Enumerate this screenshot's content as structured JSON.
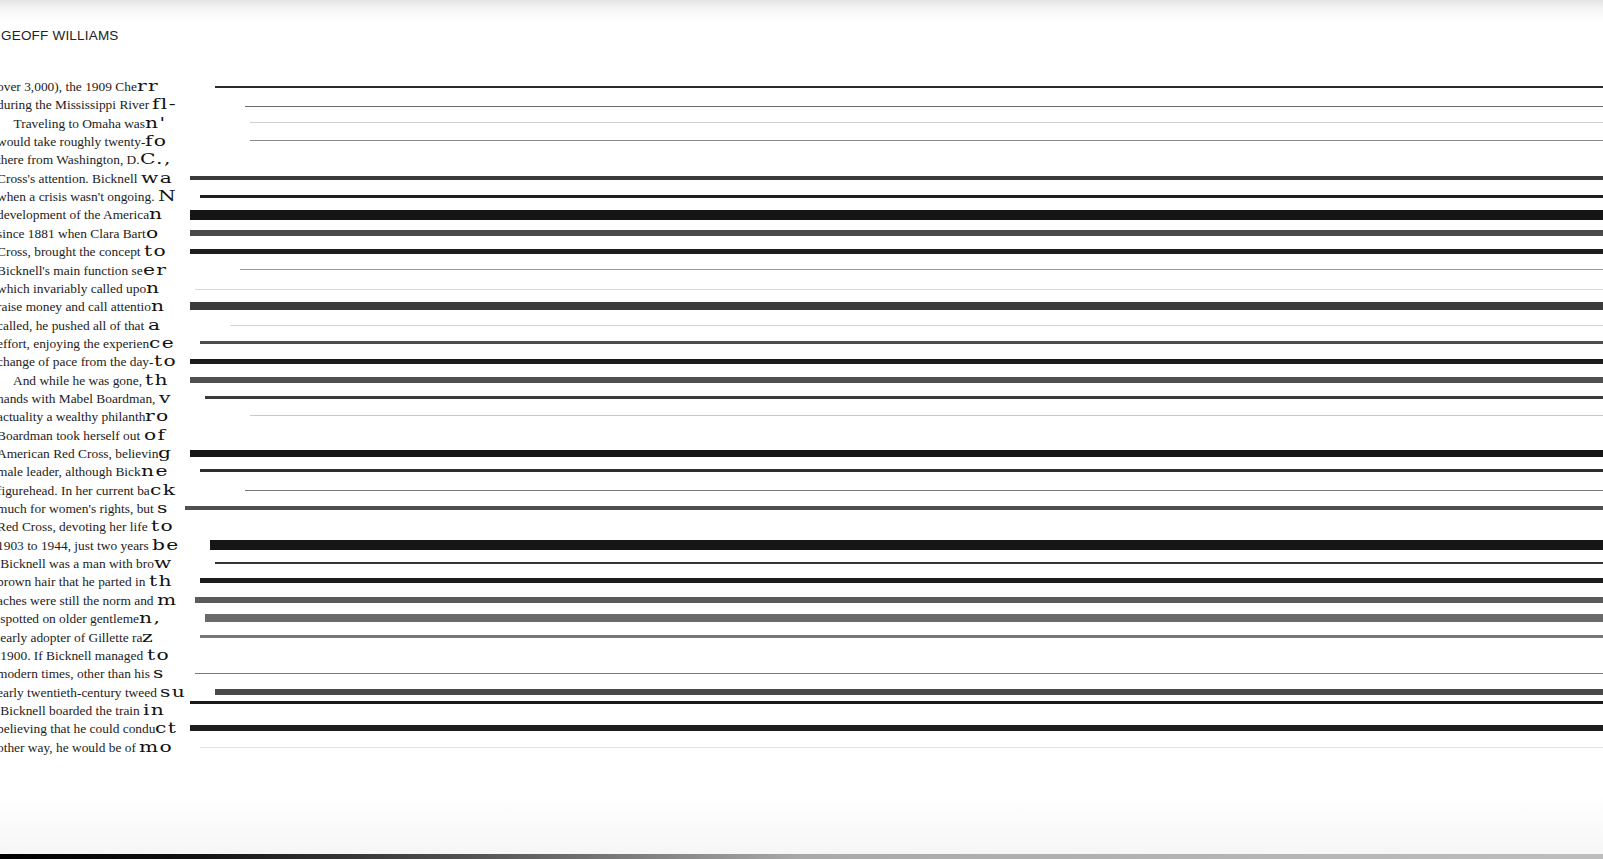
{
  "running_head": "GEOFF WILLIAMS",
  "lines": [
    {
      "text": "over 3,000), the 1909 Che",
      "tail": "rr",
      "streak": {
        "x": 215,
        "y": 9,
        "h": 2,
        "color": "#2a2a2a"
      }
    },
    {
      "text": "during the Mississippi River ",
      "tail": "fl-",
      "streak": {
        "x": 245,
        "y": 11,
        "h": 1,
        "color": "#6a6a6a"
      }
    },
    {
      "text": "     Traveling to Omaha was",
      "tail": "n'",
      "streak": {
        "x": 250,
        "y": 8,
        "h": 1,
        "color": "#cfcfcf"
      }
    },
    {
      "text": "would take roughly twenty-",
      "tail": "fo",
      "streak": {
        "x": 250,
        "y": 8,
        "h": 1,
        "color": "#8a8a8a"
      }
    },
    {
      "text": "there from Washington, D.",
      "tail": "C.,",
      "streak": null
    },
    {
      "text": "Cross's attention. Bicknell ",
      "tail": "wa",
      "streak": {
        "x": 190,
        "y": 7,
        "h": 4,
        "color": "#3a3a3a"
      }
    },
    {
      "text": "when a crisis wasn't ongoing. ",
      "tail": "N",
      "streak": {
        "x": 200,
        "y": 8,
        "h": 3,
        "color": "#1f1f1f"
      }
    },
    {
      "text": "development of the America",
      "tail": "n",
      "streak": {
        "x": 190,
        "y": 5,
        "h": 10,
        "color": "#141414"
      }
    },
    {
      "text": "since 1881 when Clara Bart",
      "tail": "o",
      "streak": {
        "x": 190,
        "y": 6,
        "h": 6,
        "color": "#4a4a4a"
      }
    },
    {
      "text": "Cross, brought the concept ",
      "tail": "to",
      "streak": {
        "x": 190,
        "y": 7,
        "h": 5,
        "color": "#1e1e1e"
      }
    },
    {
      "text": "Bicknell's main function se",
      "tail": "er",
      "streak": {
        "x": 240,
        "y": 8,
        "h": 1,
        "color": "#9a9a9a"
      }
    },
    {
      "text": "which invariably called upo",
      "tail": "n",
      "streak": {
        "x": 195,
        "y": 10,
        "h": 1,
        "color": "#d8d8d8"
      }
    },
    {
      "text": "raise money and call attentio",
      "tail": "n",
      "streak": {
        "x": 190,
        "y": 5,
        "h": 8,
        "color": "#3c3c3c"
      }
    },
    {
      "text": "called, he pushed all of that ",
      "tail": "a",
      "streak": {
        "x": 230,
        "y": 9,
        "h": 1,
        "color": "#d4d4d4"
      }
    },
    {
      "text": "effort, enjoying the experien",
      "tail": "ce",
      "streak": {
        "x": 200,
        "y": 7,
        "h": 3,
        "color": "#4e4e4e"
      }
    },
    {
      "text": "change of pace from the day-",
      "tail": "to",
      "streak": {
        "x": 190,
        "y": 7,
        "h": 5,
        "color": "#1b1b1b"
      }
    },
    {
      "text": "     And while he was gone, ",
      "tail": "th",
      "streak": {
        "x": 190,
        "y": 6,
        "h": 6,
        "color": "#505050"
      }
    },
    {
      "text": "hands with Mabel Boardman, ",
      "tail": "v",
      "streak": {
        "x": 205,
        "y": 7,
        "h": 3,
        "color": "#3a3a3a"
      }
    },
    {
      "text": "actuality a wealthy philanth",
      "tail": "ro",
      "streak": {
        "x": 250,
        "y": 8,
        "h": 1,
        "color": "#c9c9c9"
      }
    },
    {
      "text": "Boardman took herself out ",
      "tail": "of",
      "streak": null
    },
    {
      "text": "American Red Cross, believin",
      "tail": "g",
      "streak": {
        "x": 190,
        "y": 6,
        "h": 7,
        "color": "#161616"
      }
    },
    {
      "text": "male leader, although Bick",
      "tail": "ne",
      "streak": {
        "x": 200,
        "y": 7,
        "h": 3,
        "color": "#2e2e2e"
      }
    },
    {
      "text": "figurehead. In her current ba",
      "tail": "ck",
      "streak": {
        "x": 245,
        "y": 9,
        "h": 1,
        "color": "#7a7a7a"
      }
    },
    {
      "text": "much for women's rights, but ",
      "tail": "s",
      "streak": {
        "x": 185,
        "y": 7,
        "h": 4,
        "color": "#505050"
      }
    },
    {
      "text": "Red Cross, devoting her life ",
      "tail": "to",
      "streak": null
    },
    {
      "text": "1903 to 1944, just two years ",
      "tail": "be",
      "streak": {
        "x": 210,
        "y": 4,
        "h": 10,
        "color": "#161616"
      }
    },
    {
      "text": " Bicknell was a man with bro",
      "tail": "w",
      "streak": {
        "x": 215,
        "y": 8,
        "h": 2,
        "color": "#333333"
      }
    },
    {
      "text": "brown hair that he parted in ",
      "tail": "th",
      "streak": {
        "x": 200,
        "y": 6,
        "h": 5,
        "color": "#1c1c1c"
      }
    },
    {
      "text": "aches were still the norm and ",
      "tail": "m",
      "streak": {
        "x": 195,
        "y": 6,
        "h": 6,
        "color": "#5a5a5a"
      }
    },
    {
      "text": " spotted on older gentleme",
      "tail": "n,",
      "streak": {
        "x": 205,
        "y": 5,
        "h": 8,
        "color": "#6a6a6a"
      }
    },
    {
      "text": " early adopter of Gillette ra",
      "tail": "z",
      "streak": {
        "x": 200,
        "y": 7,
        "h": 3,
        "color": "#777777"
      }
    },
    {
      "text": " 1900. If Bicknell managed ",
      "tail": "to",
      "streak": null
    },
    {
      "text": "modern times, other than his ",
      "tail": "s",
      "streak": {
        "x": 195,
        "y": 9,
        "h": 1,
        "color": "#7a7a7a"
      }
    },
    {
      "text": "early twentieth-century tweed ",
      "tail": "su",
      "streak": {
        "x": 215,
        "y": 6,
        "h": 6,
        "color": "#4a4a4a"
      }
    },
    {
      "text": " Bicknell boarded the train ",
      "tail": "in",
      "streak": {
        "x": 190,
        "y": 0,
        "h": 3,
        "color": "#1a1a1a"
      }
    },
    {
      "text": "believing that he could condu",
      "tail": "ct",
      "streak": {
        "x": 190,
        "y": 6,
        "h": 6,
        "color": "#1e1e1e"
      }
    },
    {
      "text": "other way, he would be of ",
      "tail": "mo",
      "streak": {
        "x": 200,
        "y": 9,
        "h": 1,
        "color": "#e2e2e2"
      }
    }
  ]
}
